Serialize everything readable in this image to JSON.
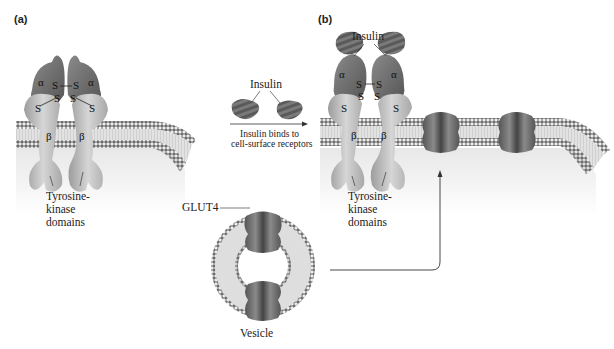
{
  "figure": {
    "panel_a": {
      "label": "(a)",
      "alpha": "α",
      "beta": "β",
      "disulfide": "S",
      "tk_label_lines": [
        "Tyrosine-",
        "kinase",
        "domains"
      ]
    },
    "transition": {
      "insulin_label": "Insulin",
      "caption_lines": [
        "Insulin binds to",
        "cell-surface receptors"
      ]
    },
    "vesicle": {
      "glut4_label": "GLUT4",
      "vesicle_label": "Vesicle"
    },
    "panel_b": {
      "label": "(b)",
      "insulin_label": "Insulin",
      "alpha": "α",
      "beta": "β",
      "disulfide": "S",
      "tk_label_lines": [
        "Tyrosine-",
        "kinase",
        "domains"
      ]
    }
  },
  "colors": {
    "membrane_head": "#6e6e6e",
    "membrane_core": "#dcdcdc",
    "alpha_subunit": "#7a7a7a",
    "beta_subunit": "#bdbdbd",
    "insulin": "#6a6a6a",
    "glut4": "#6b6b6b"
  }
}
